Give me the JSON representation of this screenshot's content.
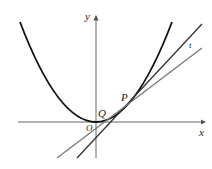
{
  "diagram": {
    "type": "coordinate-plot",
    "labels": {
      "x_axis": "x",
      "y_axis": "y",
      "origin": "O",
      "point_p": "P",
      "point_q": "Q",
      "line_t": "t"
    },
    "colors": {
      "axis": "#555555",
      "curve": "#111111",
      "tangent_line": "#333333",
      "line_t": "#777777"
    },
    "elements": {
      "curve": "parabola with vertex at origin",
      "tangent_line": "line tangent to curve at P",
      "line_t": "secant line t through Q and P"
    }
  }
}
